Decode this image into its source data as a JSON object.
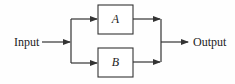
{
  "diagram": {
    "type": "block-diagram-parallel",
    "input_label": "Input",
    "output_label": "Output",
    "blocks": [
      {
        "id": "A",
        "label": "A"
      },
      {
        "id": "B",
        "label": "B"
      }
    ],
    "connections": [
      {
        "from": "Input",
        "to": "split"
      },
      {
        "from": "split",
        "to": "A"
      },
      {
        "from": "split",
        "to": "B"
      },
      {
        "from": "A",
        "to": "merge"
      },
      {
        "from": "B",
        "to": "merge"
      },
      {
        "from": "merge",
        "to": "Output"
      }
    ],
    "colors": {
      "stroke": "#333333",
      "background": "#ffffff"
    }
  }
}
